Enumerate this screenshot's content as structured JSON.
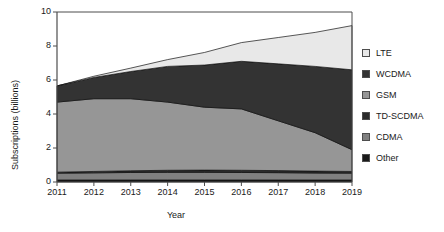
{
  "chart_data": {
    "type": "area",
    "stacked": true,
    "title": "",
    "xlabel": "Year",
    "ylabel": "Subscriptions (billions)",
    "x": [
      2011,
      2012,
      2013,
      2014,
      2015,
      2016,
      2017,
      2018,
      2019
    ],
    "xtick_labels": [
      "2011",
      "2012",
      "2013",
      "2014",
      "2015",
      "2016",
      "2017",
      "2018",
      "2019"
    ],
    "xlim": [
      2011,
      2019
    ],
    "ylim": [
      0,
      10
    ],
    "ytick_labels": [
      "0",
      "2",
      "4",
      "6",
      "8",
      "10"
    ],
    "yticks": [
      0,
      2,
      4,
      6,
      8,
      10
    ],
    "grid": false,
    "legend_position": "right",
    "stack_order_bottom_to_top": [
      "Other",
      "CDMA",
      "TD-SCDMA",
      "GSM",
      "WCDMA",
      "LTE"
    ],
    "series": [
      {
        "name": "Other",
        "color": "#1a1a1a",
        "values": [
          0.12,
          0.12,
          0.12,
          0.12,
          0.12,
          0.12,
          0.12,
          0.12,
          0.12
        ]
      },
      {
        "name": "CDMA",
        "color": "#808080",
        "values": [
          0.4,
          0.42,
          0.44,
          0.45,
          0.45,
          0.44,
          0.43,
          0.41,
          0.4
        ]
      },
      {
        "name": "TD-SCDMA",
        "color": "#2b2b2b",
        "values": [
          0.06,
          0.08,
          0.1,
          0.12,
          0.13,
          0.13,
          0.12,
          0.11,
          0.1
        ]
      },
      {
        "name": "GSM",
        "color": "#969696",
        "values": [
          4.12,
          4.28,
          4.24,
          4.01,
          3.7,
          3.61,
          2.93,
          2.26,
          1.28
        ]
      },
      {
        "name": "WCDMA",
        "color": "#333333",
        "values": [
          0.95,
          1.25,
          1.6,
          2.1,
          2.48,
          2.8,
          3.35,
          3.9,
          4.7
        ]
      },
      {
        "name": "LTE",
        "color": "#e8e8e8",
        "values": [
          0.0,
          0.07,
          0.2,
          0.4,
          0.74,
          1.1,
          1.55,
          2.0,
          2.6
        ]
      }
    ],
    "stacked_totals": [
      5.65,
      6.22,
      6.7,
      7.2,
      7.62,
      8.2,
      8.5,
      8.8,
      9.2
    ]
  },
  "legend": {
    "items": [
      {
        "label": "LTE",
        "color": "#e8e8e8"
      },
      {
        "label": "WCDMA",
        "color": "#333333"
      },
      {
        "label": "GSM",
        "color": "#969696"
      },
      {
        "label": "TD-SCDMA",
        "color": "#2b2b2b"
      },
      {
        "label": "CDMA",
        "color": "#808080"
      },
      {
        "label": "Other",
        "color": "#1a1a1a"
      }
    ]
  },
  "axes": {
    "x_title": "Year",
    "y_title": "Subscriptions (billions)"
  }
}
